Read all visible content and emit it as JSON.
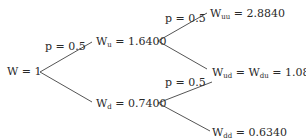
{
  "diagram": {
    "type": "binomial-tree",
    "root": {
      "label": "W",
      "value": "1"
    },
    "nodes": {
      "u": {
        "label": "W",
        "sub": "u",
        "value": "1.6400"
      },
      "d": {
        "label": "W",
        "sub": "d",
        "value": "0.7400"
      },
      "uu": {
        "label": "W",
        "sub": "uu",
        "value": "2.8840"
      },
      "ud": {
        "label": "W",
        "sub": "ud",
        "label2": "W",
        "sub2": "du",
        "value": "1.0840"
      },
      "dd": {
        "label": "W",
        "sub": "dd",
        "value": "0.6340"
      }
    },
    "probabilities": {
      "root_up": "p = 0.5",
      "u_up": "p = 0.5",
      "d_up": "p = 0.5"
    },
    "line_color": "#555555"
  }
}
